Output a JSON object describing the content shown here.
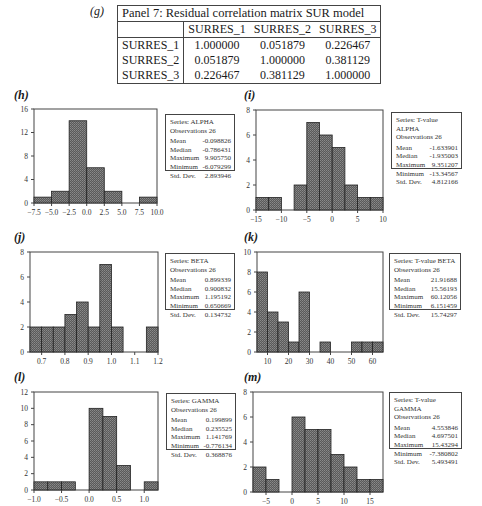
{
  "correlation_panel": {
    "letter": "(g)",
    "title": "Panel 7: Residual correlation matrix SUR model",
    "columns": [
      "SURRES_1",
      "SURRES_2",
      "SURRES_3"
    ],
    "rows": [
      {
        "label": "SURRES_1",
        "values": [
          "1.000000",
          "0.051879",
          "0.226467"
        ]
      },
      {
        "label": "SURRES_2",
        "values": [
          "0.051879",
          "1.000000",
          "0.381129"
        ]
      },
      {
        "label": "SURRES_3",
        "values": [
          "0.226467",
          "0.381129",
          "1.000000"
        ]
      }
    ]
  },
  "panels": {
    "h": {
      "letter": "(h)",
      "series": "Series: ALPHA",
      "obs": "Observations 26",
      "stats": [
        [
          "Mean",
          "-0.098826"
        ],
        [
          "Median",
          "-0.786431"
        ],
        [
          "Maximum",
          "9.905750"
        ],
        [
          "Minimum",
          "-6.079299"
        ],
        [
          "Std. Dev.",
          "2.893946"
        ]
      ]
    },
    "i": {
      "letter": "(i)",
      "series": "Series: T-value ALPHA",
      "obs": "Observations 26",
      "stats": [
        [
          "Mean",
          "-1.633901"
        ],
        [
          "Median",
          "-1.935003"
        ],
        [
          "Maximum",
          "9.351207"
        ],
        [
          "Minimum",
          "-13.34567"
        ],
        [
          "Std. Dev.",
          "4.812166"
        ]
      ]
    },
    "j": {
      "letter": "(j)",
      "series": "Series: BETA",
      "obs": "Observations 26",
      "stats": [
        [
          "Mean",
          "0.899339"
        ],
        [
          "Median",
          "0.900832"
        ],
        [
          "Maximum",
          "1.195192"
        ],
        [
          "Minimum",
          "0.650669"
        ],
        [
          "Std. Dev.",
          "0.134732"
        ]
      ]
    },
    "k": {
      "letter": "(k)",
      "series": "Series: T-value BETA",
      "obs": "Observations 26",
      "stats": [
        [
          "Mean",
          "21.91688"
        ],
        [
          "Median",
          "15.56193"
        ],
        [
          "Maximum",
          "60.12056"
        ],
        [
          "Minimum",
          "6.151459"
        ],
        [
          "Std. Dev.",
          "15.74297"
        ]
      ]
    },
    "l": {
      "letter": "(l)",
      "series": "Series: GAMMA",
      "obs": "Observations 26",
      "stats": [
        [
          "Mean",
          "0.199899"
        ],
        [
          "Median",
          "0.235525"
        ],
        [
          "Maximum",
          "1.141769"
        ],
        [
          "Minimum",
          "-0.776134"
        ],
        [
          "Std. Dev.",
          "0.368876"
        ]
      ]
    },
    "m": {
      "letter": "(m)",
      "series": "Series: T-value GAMMA",
      "obs": "Observations 26",
      "stats": [
        [
          "Mean",
          "4.553846"
        ],
        [
          "Median",
          "4.697501"
        ],
        [
          "Maximum",
          "15.43294"
        ],
        [
          "Minimum",
          "-7.380802"
        ],
        [
          "Std. Dev.",
          "5.493491"
        ]
      ]
    }
  },
  "chart_data": [
    {
      "id": "h",
      "type": "bar",
      "title": "Series: ALPHA",
      "xlabel": "",
      "ylabel": "",
      "bin_edges": [
        -7.5,
        -5.0,
        -2.5,
        0.0,
        2.5,
        5.0,
        7.5,
        10.0
      ],
      "values": [
        1,
        2,
        14,
        6,
        2,
        0,
        1
      ],
      "xticks": [
        "-7.5",
        "-5.0",
        "-2.5",
        "0.0",
        "2.5",
        "5.0",
        "7.5",
        "10.0"
      ],
      "yticks": [
        "0",
        "4",
        "8",
        "12",
        "16"
      ],
      "ylim": [
        0,
        16
      ],
      "xlim": [
        -7.5,
        10.0
      ]
    },
    {
      "id": "i",
      "type": "bar",
      "title": "Series: T-value ALPHA",
      "xlabel": "",
      "ylabel": "",
      "bin_edges": [
        -15,
        -12.5,
        -10,
        -7.5,
        -5,
        -2.5,
        0,
        2.5,
        5,
        7.5,
        10
      ],
      "values": [
        1,
        1,
        0,
        2,
        7,
        6,
        5,
        2,
        1,
        1
      ],
      "xticks": [
        "-15",
        "-10",
        "-5",
        "0",
        "5",
        "10"
      ],
      "yticks": [
        "0",
        "2",
        "4",
        "6",
        "8"
      ],
      "ylim": [
        0,
        8
      ],
      "xlim": [
        -15,
        10
      ]
    },
    {
      "id": "j",
      "type": "bar",
      "title": "Series: BETA",
      "xlabel": "",
      "ylabel": "",
      "bin_edges": [
        0.7,
        0.75,
        0.8,
        0.85,
        0.9,
        0.95,
        1.0,
        1.05,
        1.1,
        1.15,
        1.2
      ],
      "values": [
        2,
        2,
        2,
        3,
        4,
        2,
        7,
        2,
        0,
        0,
        2
      ],
      "bin_edges_note": "bars drawn 0.65-1.2 approx",
      "xticks": [
        "0.7",
        "0.8",
        "0.9",
        "1.0",
        "1.1",
        "1.2"
      ],
      "yticks": [
        "0",
        "2",
        "4",
        "6",
        "8"
      ],
      "ylim": [
        0,
        8
      ],
      "xlim": [
        0.65,
        1.2
      ]
    },
    {
      "id": "k",
      "type": "bar",
      "title": "Series: T-value BETA",
      "xlabel": "",
      "ylabel": "",
      "bin_edges": [
        5,
        10,
        15,
        20,
        25,
        30,
        35,
        40,
        45,
        50,
        55,
        60,
        65
      ],
      "values": [
        8,
        4,
        3,
        1,
        6,
        0,
        1,
        0,
        0,
        1,
        1,
        1
      ],
      "xticks": [
        "10",
        "20",
        "30",
        "40",
        "50",
        "60"
      ],
      "yticks": [
        "0",
        "2",
        "4",
        "6",
        "8",
        "10"
      ],
      "ylim": [
        0,
        10
      ],
      "xlim": [
        5,
        65
      ]
    },
    {
      "id": "l",
      "type": "bar",
      "title": "Series: GAMMA",
      "xlabel": "",
      "ylabel": "",
      "bin_edges": [
        -1.0,
        -0.75,
        -0.5,
        -0.25,
        0.0,
        0.25,
        0.5,
        0.75,
        1.0,
        1.25
      ],
      "values": [
        1,
        1,
        1,
        0,
        10,
        9,
        3,
        0,
        1
      ],
      "xticks": [
        "-1.0",
        "-0.5",
        "0.0",
        "0.5",
        "1.0"
      ],
      "yticks": [
        "0",
        "2",
        "4",
        "6",
        "8",
        "10",
        "12"
      ],
      "ylim": [
        0,
        12
      ],
      "xlim": [
        -1.0,
        1.25
      ]
    },
    {
      "id": "m",
      "type": "bar",
      "title": "Series: T-value GAMMA",
      "xlabel": "",
      "ylabel": "",
      "bin_edges": [
        -7.5,
        -5,
        -2.5,
        0,
        2.5,
        5,
        7.5,
        10,
        12.5,
        15,
        17.5
      ],
      "values": [
        2,
        1,
        0,
        6,
        5,
        5,
        3,
        2,
        1,
        1
      ],
      "xticks": [
        "-5",
        "0",
        "5",
        "10",
        "15"
      ],
      "yticks": [
        "0",
        "2",
        "4",
        "6",
        "8"
      ],
      "ylim": [
        0,
        8
      ],
      "xlim": [
        -7.5,
        17.5
      ]
    }
  ]
}
